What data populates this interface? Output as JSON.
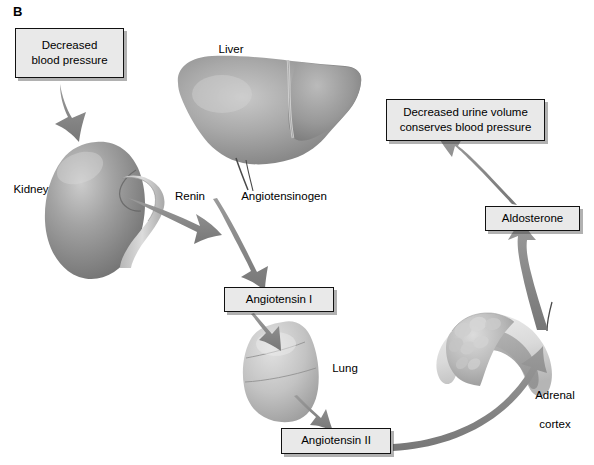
{
  "figure": {
    "panel_label": "B",
    "type": "diagram",
    "background_color": "#ffffff",
    "box_fill_color": "#e9e9e9",
    "box_border_color": "#111111",
    "arrow_color": "#8a8a8a"
  },
  "boxes": [
    {
      "id": "decreased-blood-pressure",
      "line1": "Decreased",
      "line2": "blood pressure"
    },
    {
      "id": "angiotensin-1",
      "label": "Angiotensin I"
    },
    {
      "id": "angiotensin-2",
      "label": "Angiotensin II"
    },
    {
      "id": "aldosterone",
      "label": "Aldosterone"
    },
    {
      "id": "decreased-urine-volume",
      "line1": "Decreased urine volume",
      "line2": "conserves blood pressure"
    }
  ],
  "organs": [
    {
      "id": "liver",
      "label": "Liver"
    },
    {
      "id": "kidney",
      "label": "Kidney"
    },
    {
      "id": "lung",
      "label": "Lung"
    },
    {
      "id": "adrenal-cortex",
      "line1": "Adrenal",
      "line2": "cortex"
    }
  ],
  "process_labels": [
    {
      "id": "renin",
      "label": "Renin"
    },
    {
      "id": "angiotensinogen",
      "label": "Angiotensinogen"
    }
  ],
  "flow": [
    {
      "from": "decreased-blood-pressure",
      "to": "kidney"
    },
    {
      "from": "kidney",
      "to": "renin"
    },
    {
      "from": "liver",
      "to": "angiotensin-1",
      "via": "angiotensinogen"
    },
    {
      "from": "angiotensin-1",
      "to": "lung"
    },
    {
      "from": "lung",
      "to": "angiotensin-2"
    },
    {
      "from": "angiotensin-2",
      "to": "adrenal-cortex"
    },
    {
      "from": "adrenal-cortex",
      "to": "aldosterone"
    },
    {
      "from": "aldosterone",
      "to": "decreased-urine-volume"
    }
  ]
}
